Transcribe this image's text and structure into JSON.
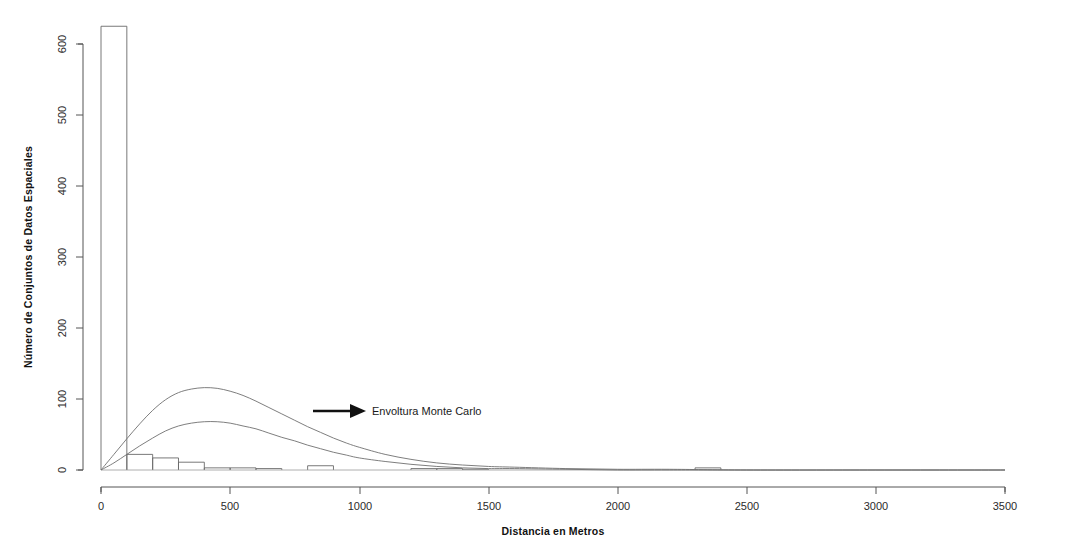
{
  "figure": {
    "background_color": "#ffffff",
    "line_color": "#6a6a6a",
    "text_color": "#1a1a1a"
  },
  "annotation": {
    "label": "Envoltura Monte Carlo",
    "arrow_icon": "arrow-right-icon"
  },
  "axes": {
    "x_title": "Distancia en Metros",
    "y_title": "Número de Conjuntos de Datos Espaciales",
    "x_ticks": [
      "0",
      "500",
      "1000",
      "1500",
      "2000",
      "2500",
      "3000",
      "3500"
    ],
    "y_ticks": [
      "0",
      "100",
      "200",
      "300",
      "400",
      "500",
      "600"
    ]
  },
  "chart_data": {
    "type": "bar",
    "title": "",
    "subtitle": "",
    "xlabel": "Distancia en Metros",
    "ylabel": "Número de Conjuntos de Datos Espaciales",
    "xlim": [
      0,
      3500
    ],
    "ylim": [
      0,
      630
    ],
    "grid": false,
    "legend_position": "none",
    "x_tick_values": [
      0,
      500,
      1000,
      1500,
      2000,
      2500,
      3000,
      3500
    ],
    "y_tick_values": [
      0,
      100,
      200,
      300,
      400,
      500,
      600
    ],
    "bin_width": 100,
    "bin_edges": [
      0,
      100,
      200,
      300,
      400,
      500,
      600,
      700,
      800,
      900,
      1000,
      1100,
      1200,
      1300,
      1400,
      1500,
      1600,
      1700,
      1800,
      1900,
      2000,
      2100,
      2200,
      2300,
      2400,
      2500,
      2600,
      2700,
      2800,
      2900,
      3000,
      3100,
      3200,
      3300,
      3400,
      3500
    ],
    "categories": [
      "0-100",
      "100-200",
      "200-300",
      "300-400",
      "400-500",
      "500-600",
      "600-700",
      "700-800",
      "800-900",
      "900-1000",
      "1000-1100",
      "1100-1200",
      "1200-1300",
      "1300-1400",
      "1400-1500",
      "1500-1600",
      "1600-1700",
      "1700-1800",
      "1800-1900",
      "1900-2000",
      "2000-2100",
      "2100-2200",
      "2200-2300",
      "2300-2400",
      "2400-2500",
      "2500-2600",
      "2600-2700",
      "2700-2800",
      "2800-2900",
      "2900-3000",
      "3000-3100",
      "3100-3200",
      "3200-3300",
      "3300-3400",
      "3400-3500"
    ],
    "values": [
      625,
      22,
      17,
      11,
      3,
      3,
      2,
      0,
      6,
      0,
      0,
      0,
      2,
      2,
      1,
      0,
      0,
      0,
      0,
      0,
      0,
      0,
      0,
      3,
      0,
      0,
      0,
      0,
      0,
      0,
      0,
      0,
      0,
      0,
      0
    ],
    "series": [
      {
        "name": "Envoltura Monte Carlo superior",
        "type": "line",
        "x": [
          0,
          50,
          100,
          150,
          200,
          250,
          300,
          350,
          400,
          450,
          500,
          550,
          600,
          650,
          700,
          750,
          800,
          850,
          900,
          950,
          1000,
          1100,
          1200,
          1300,
          1400,
          1500,
          1600,
          1800,
          2000,
          2200,
          2500,
          3000,
          3500
        ],
        "y": [
          0,
          22,
          44,
          65,
          84,
          99,
          109,
          114,
          116,
          115,
          111,
          105,
          97,
          88,
          79,
          70,
          61,
          53,
          45,
          38,
          32,
          22,
          15,
          10,
          7,
          5,
          4,
          2,
          1,
          1,
          0,
          0,
          0
        ]
      },
      {
        "name": "Envoltura Monte Carlo inferior",
        "type": "line",
        "x": [
          0,
          50,
          100,
          150,
          200,
          250,
          300,
          350,
          400,
          450,
          500,
          550,
          600,
          650,
          700,
          750,
          800,
          850,
          900,
          950,
          1000,
          1100,
          1200,
          1300,
          1400,
          1500,
          1600,
          1800,
          2000,
          2200,
          2500,
          3000,
          3500
        ],
        "y": [
          0,
          10,
          22,
          34,
          45,
          55,
          62,
          66,
          68,
          68,
          66,
          62,
          58,
          52,
          46,
          41,
          35,
          30,
          25,
          21,
          17,
          12,
          8,
          5,
          3,
          2,
          2,
          1,
          0,
          0,
          0,
          0,
          0
        ]
      }
    ],
    "annotations": [
      {
        "text": "Envoltura Monte Carlo",
        "x": 1050,
        "y": 55,
        "arrow_from_x": 790,
        "arrow_to_x": 1030
      }
    ]
  }
}
